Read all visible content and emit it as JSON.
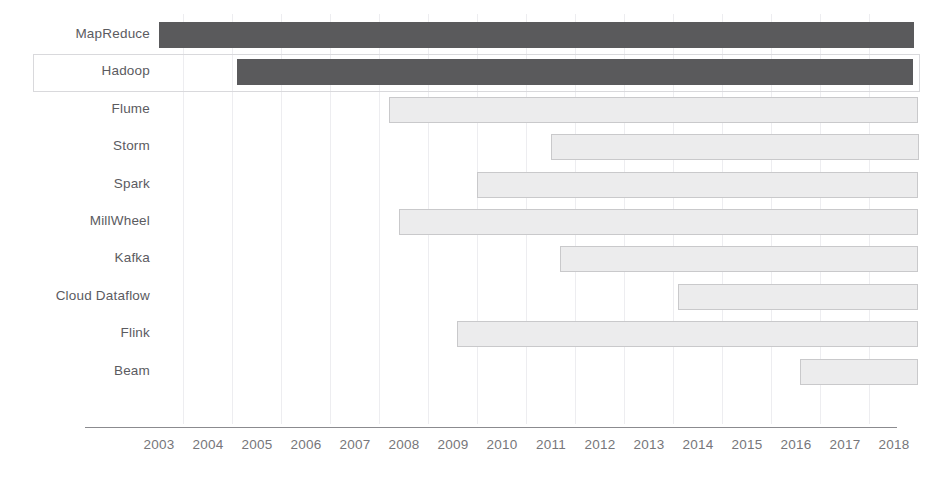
{
  "chart_data": {
    "type": "bar",
    "orientation": "horizontal",
    "subtype": "gantt-timeline",
    "title": "",
    "subtitle": "",
    "xlabel": "",
    "ylabel": "",
    "xlim": [
      2002.5,
      2018.9
    ],
    "grid": true,
    "grid_axis": "x",
    "legend": null,
    "axis_tick_labels": [
      "2003",
      "2004",
      "2005",
      "2006",
      "2007",
      "2008",
      "2009",
      "2010",
      "2011",
      "2012",
      "2013",
      "2014",
      "2015",
      "2016",
      "2017",
      "2018"
    ],
    "axis_tick_values": [
      2003,
      2004,
      2005,
      2006,
      2007,
      2008,
      2009,
      2010,
      2011,
      2012,
      2013,
      2014,
      2015,
      2016,
      2017,
      2018
    ],
    "categories": [
      "MapReduce",
      "Hadoop",
      "Flume",
      "Storm",
      "Spark",
      "MillWheel",
      "Kafka",
      "Cloud Dataflow",
      "Flink",
      "Beam"
    ],
    "series": [
      {
        "name": "Project lifespan",
        "bars": [
          {
            "label": "MapReduce",
            "start": 2003.0,
            "end": 2018.4,
            "style": "dark"
          },
          {
            "label": "Hadoop",
            "start": 2004.6,
            "end": 2018.4,
            "style": "dark"
          },
          {
            "label": "Flume",
            "start": 2007.7,
            "end": 2018.5,
            "style": "light"
          },
          {
            "label": "Storm",
            "start": 2011.0,
            "end": 2018.5,
            "style": "light"
          },
          {
            "label": "Spark",
            "start": 2009.5,
            "end": 2018.5,
            "style": "light"
          },
          {
            "label": "MillWheel",
            "start": 2007.9,
            "end": 2018.5,
            "style": "light"
          },
          {
            "label": "Kafka",
            "start": 2011.2,
            "end": 2018.5,
            "style": "light"
          },
          {
            "label": "Cloud Dataflow",
            "start": 2013.6,
            "end": 2018.5,
            "style": "light"
          },
          {
            "label": "Flink",
            "start": 2009.1,
            "end": 2018.5,
            "style": "light"
          },
          {
            "label": "Beam",
            "start": 2016.1,
            "end": 2018.5,
            "style": "light"
          }
        ]
      }
    ],
    "highlighted_category": "Hadoop",
    "colors": {
      "bar_dark": "#5a5a5c",
      "bar_light_fill": "#ececed",
      "bar_light_border": "#c9c9cb",
      "gridline": "#ededf0",
      "axis": "#8b8b8f",
      "tick_text": "#76767a",
      "label_text": "#5b5b5f",
      "selection_border": "#d9d9dc",
      "background": "#ffffff"
    }
  },
  "rows": [
    {
      "label": "MapReduce",
      "start": 2003.0,
      "end": 2018.4,
      "style": "dark",
      "selected": false
    },
    {
      "label": "Hadoop",
      "start": 2004.6,
      "end": 2018.4,
      "style": "dark",
      "selected": true
    },
    {
      "label": "Flume",
      "start": 2007.7,
      "end": 2018.5,
      "style": "light",
      "selected": false
    },
    {
      "label": "Storm",
      "start": 2011.0,
      "end": 2018.5,
      "style": "light",
      "selected": false
    },
    {
      "label": "Spark",
      "start": 2009.5,
      "end": 2018.5,
      "style": "light",
      "selected": false
    },
    {
      "label": "MillWheel",
      "start": 2007.9,
      "end": 2018.5,
      "style": "light",
      "selected": false
    },
    {
      "label": "Kafka",
      "start": 2011.2,
      "end": 2018.5,
      "style": "light",
      "selected": false
    },
    {
      "label": "Cloud Dataflow",
      "start": 2013.6,
      "end": 2018.5,
      "style": "light",
      "selected": false
    },
    {
      "label": "Flink",
      "start": 2009.1,
      "end": 2018.5,
      "style": "light",
      "selected": false
    },
    {
      "label": "Beam",
      "start": 2016.1,
      "end": 2018.5,
      "style": "light",
      "selected": false
    }
  ]
}
